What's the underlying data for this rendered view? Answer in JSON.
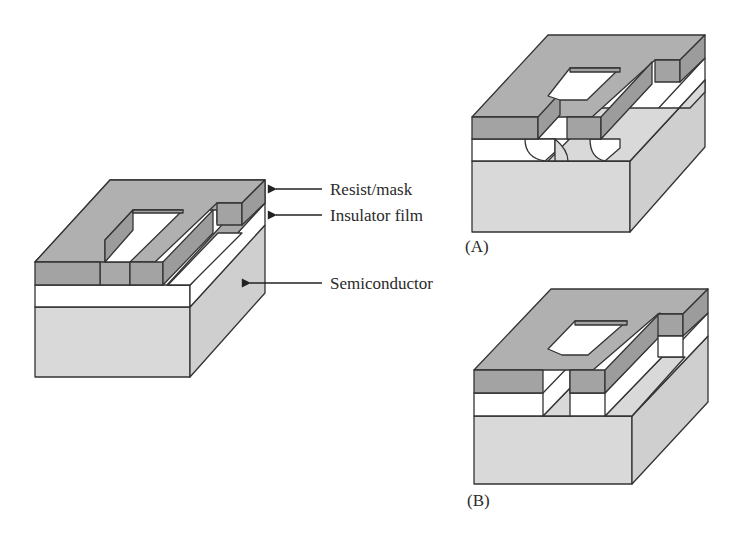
{
  "figure": {
    "colors": {
      "resist": "#a9a9a9",
      "resist_side": "#9c9c9c",
      "insulator": "#ffffff",
      "semiconductor": "#d9d9d9",
      "semiconductor_side": "#cfcfcf",
      "edge": "#333333",
      "text": "#2a2a2a"
    },
    "labels": {
      "resist": "Resist/mask",
      "insulator": "Insulator film",
      "semiconductor": "Semiconductor"
    },
    "panels": {
      "a": "(A)",
      "b": "(B)"
    }
  }
}
